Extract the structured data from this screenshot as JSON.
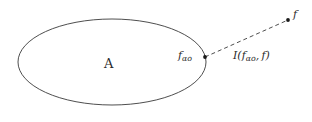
{
  "figure": {
    "type": "mathematical-diagram",
    "background_color": "#ffffff",
    "stroke_color": "#3a3a3a",
    "text_color": "#2b2b2b",
    "width": 312,
    "height": 122,
    "shapes": {
      "set_ellipse": {
        "name": "ellipse-set-A",
        "cx": 112,
        "cy": 62,
        "rx": 94,
        "ry": 43,
        "stroke": "#3a3a3a",
        "stroke_width": 0.9,
        "fill": "none"
      },
      "connector": {
        "name": "dashed-segment",
        "x1": 205,
        "y1": 57,
        "x2": 288,
        "y2": 20,
        "stroke": "#3a3a3a",
        "stroke_width": 0.9,
        "dash_pattern": "4 3"
      },
      "boundary_point": {
        "name": "point-f-alpha",
        "cx": 205,
        "cy": 57,
        "r": 1.9,
        "fill": "#1a1a1a"
      },
      "outer_point": {
        "name": "point-f",
        "cx": 288,
        "cy": 20,
        "r": 1.9,
        "fill": "#1a1a1a"
      }
    },
    "labels": {
      "set_label": "A",
      "boundary_point_label": {
        "base": "f",
        "subscript": "α",
        "sub_subscript": "o"
      },
      "interval_label": {
        "operator": "I",
        "open_paren": "(",
        "first_base": "f",
        "first_subscript": "α",
        "first_sub_subscript": "o",
        "comma": ",",
        "second_arg": "f",
        "close_paren": ")"
      },
      "outer_point_label": "f"
    }
  }
}
